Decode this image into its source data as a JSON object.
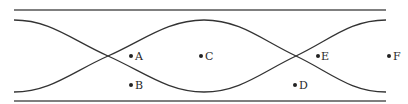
{
  "diagram": {
    "colors": {
      "line": "#333333",
      "wall": "#555555",
      "background": "#ffffff"
    },
    "points": [
      {
        "label": "A",
        "x": 131,
        "y": 56
      },
      {
        "label": "B",
        "x": 131,
        "y": 85
      },
      {
        "label": "C",
        "x": 201,
        "y": 56
      },
      {
        "label": "D",
        "x": 295,
        "y": 85
      },
      {
        "label": "E",
        "x": 318,
        "y": 56
      },
      {
        "label": "F",
        "x": 387,
        "y": 56
      }
    ]
  }
}
